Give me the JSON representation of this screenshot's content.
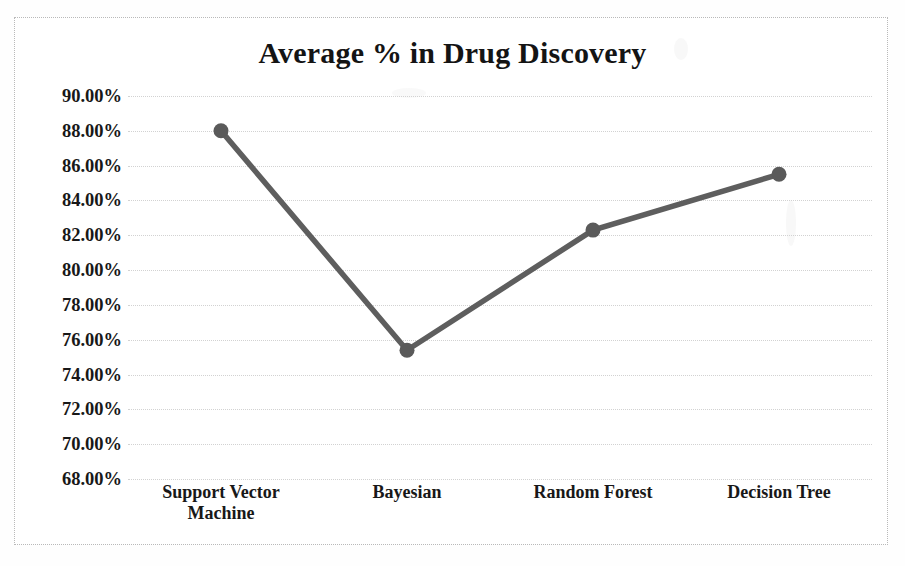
{
  "chart_data": {
    "type": "line",
    "title": "Average % in Drug Discovery",
    "xlabel": "",
    "ylabel": "",
    "categories": [
      "Support Vector Machine",
      "Bayesian",
      "Random Forest",
      "Decision Tree"
    ],
    "values": [
      88.0,
      75.4,
      82.3,
      85.5
    ],
    "value_labels": [
      "88.00%",
      "75.40%",
      "82.30%",
      "85.50%"
    ],
    "series": [
      {
        "name": "Average %",
        "values": [
          88.0,
          75.4,
          82.3,
          85.5
        ]
      }
    ],
    "ylim": [
      68.0,
      90.0
    ],
    "ytick_step": 2.0,
    "ytick_labels": [
      "90.00%",
      "88.00%",
      "86.00%",
      "84.00%",
      "82.00%",
      "80.00%",
      "78.00%",
      "76.00%",
      "74.00%",
      "72.00%",
      "70.00%",
      "68.00%"
    ],
    "ytick_values": [
      90,
      88,
      86,
      84,
      82,
      80,
      78,
      76,
      74,
      72,
      70,
      68
    ],
    "grid": "horizontal-dotted",
    "legend": "none",
    "legend_position": "none",
    "marker": "circle",
    "line_color": "#5e5e5e",
    "marker_color": "#5a5a5a",
    "grid_color": "#d2d2d2",
    "text_color": "#181818",
    "background_color": "#ffffff",
    "border_color": "#b9b9b9"
  },
  "xaxis": {
    "category_lines": [
      [
        "Support Vector",
        "Machine"
      ],
      [
        "Bayesian"
      ],
      [
        "Random Forest"
      ],
      [
        "Decision Tree"
      ]
    ]
  }
}
